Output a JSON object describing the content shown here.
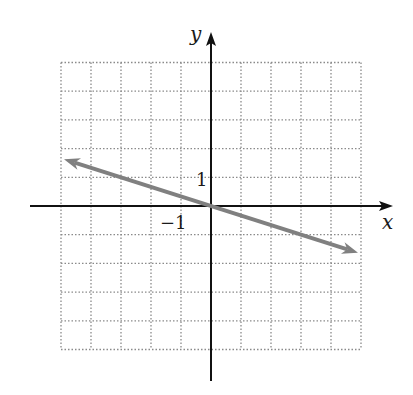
{
  "chart_data": {
    "type": "line",
    "title": "",
    "xlabel": "x",
    "ylabel": "y",
    "xlim": [
      -5,
      5
    ],
    "ylim": [
      -5,
      5
    ],
    "grid": true,
    "grid_style": "dotted",
    "tick_labels": [
      {
        "axis": "y",
        "value": 1,
        "text": "1"
      },
      {
        "axis": "x",
        "value": -1,
        "text": "−1"
      }
    ],
    "series": [
      {
        "name": "line",
        "equation": "y = -x/3",
        "slope": -0.3333,
        "intercept": 0,
        "x": [
          -4.9,
          -3,
          0,
          3,
          4.9
        ],
        "y": [
          1.63,
          1,
          0,
          -1,
          -1.63
        ],
        "arrows": "both",
        "color": "#808080"
      }
    ]
  },
  "colors": {
    "axis": "#111111",
    "grid": "#8a8a8a",
    "line": "#808080",
    "background": "#ffffff"
  },
  "labels": {
    "x_axis": "x",
    "y_axis": "y",
    "tick_y1": "1",
    "tick_xm1": "−1"
  }
}
